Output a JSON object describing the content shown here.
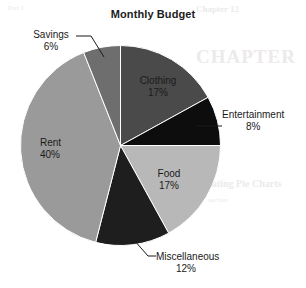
{
  "chart_data": {
    "type": "pie",
    "title": "Monthly Budget",
    "xlabel": "",
    "ylabel": "",
    "legend_position": "none",
    "grid": false,
    "unit": "%",
    "start_angle_deg": 0,
    "direction": "clockwise",
    "categories": [
      "Clothing",
      "Entertainment",
      "Food",
      "Miscellaneous",
      "Rent",
      "Savings"
    ],
    "values": [
      17,
      8,
      17,
      12,
      40,
      6
    ],
    "slices": [
      {
        "label": "Clothing",
        "value": 17,
        "value_text": "17%",
        "color": "#4a4a4a",
        "label_placement": "inside",
        "start_deg": 0,
        "end_deg": 61.2
      },
      {
        "label": "Entertainment",
        "value": 8,
        "value_text": "8%",
        "color": "#0d0d0d",
        "label_placement": "outside",
        "leader": true,
        "start_deg": 61.2,
        "end_deg": 90.0
      },
      {
        "label": "Food",
        "value": 17,
        "value_text": "17%",
        "color": "#b8b8b8",
        "label_placement": "inside",
        "start_deg": 90.0,
        "end_deg": 151.2
      },
      {
        "label": "Miscellaneous",
        "value": 12,
        "value_text": "12%",
        "color": "#1e1e1e",
        "label_placement": "outside",
        "leader": true,
        "start_deg": 151.2,
        "end_deg": 194.4
      },
      {
        "label": "Rent",
        "value": 40,
        "value_text": "40%",
        "color": "#9a9a9a",
        "label_placement": "inside",
        "start_deg": 194.4,
        "end_deg": 338.4
      },
      {
        "label": "Savings",
        "value": 6,
        "value_text": "6%",
        "color": "#6e6e6e",
        "label_placement": "outside",
        "leader": true,
        "start_deg": 338.4,
        "end_deg": 360.0
      }
    ]
  },
  "page": {
    "background": "#ffffff",
    "text_color": "#1a1a1a",
    "bleed_through": {
      "a": "CHAPTER",
      "b": "the",
      "c": "Creating Pie Charts",
      "d": "section",
      "e": "Part I",
      "f": "Chapter 12"
    }
  }
}
